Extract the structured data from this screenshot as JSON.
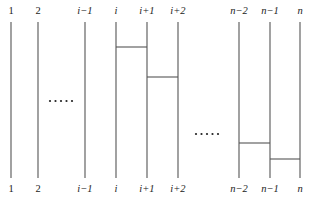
{
  "diagram": {
    "type": "wiring-ladder",
    "wires": [
      {
        "id": "w1",
        "label_top": "1",
        "label_bottom": "1",
        "x": 11
      },
      {
        "id": "w2",
        "label_top": "2",
        "label_bottom": "2",
        "x": 38
      },
      {
        "id": "wim1",
        "label_top": "i−1",
        "label_bottom": "i−1",
        "x": 85
      },
      {
        "id": "wi",
        "label_top": "i",
        "label_bottom": "i",
        "x": 116
      },
      {
        "id": "wip1",
        "label_top": "i+1",
        "label_bottom": "i+1",
        "x": 147
      },
      {
        "id": "wip2",
        "label_top": "i+2",
        "label_bottom": "i+2",
        "x": 178
      },
      {
        "id": "wnm2",
        "label_top": "n−2",
        "label_bottom": "n−2",
        "x": 239
      },
      {
        "id": "wnm1",
        "label_top": "n−1",
        "label_bottom": "n−1",
        "x": 270
      },
      {
        "id": "wn",
        "label_top": "n",
        "label_bottom": "n",
        "x": 300
      }
    ],
    "rungs": [
      {
        "from": "i",
        "to": "i+1",
        "y": 47
      },
      {
        "from": "i+1",
        "to": "i+2",
        "y": 77
      },
      {
        "from": "n−2",
        "to": "n−1",
        "y": 143
      },
      {
        "from": "n−1",
        "to": "n",
        "y": 159
      }
    ],
    "ellipses": [
      {
        "text": "·····",
        "position": "between 2 and i−1"
      },
      {
        "text": "·····",
        "position": "between i+2 and n−2"
      }
    ],
    "line_color": "#555555",
    "text_color": "#222222"
  }
}
